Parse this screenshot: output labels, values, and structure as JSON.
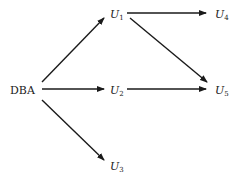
{
  "diagram": {
    "nodes": [
      {
        "id": "DBA",
        "label": "DBA",
        "sub": "",
        "x": 10,
        "y": 94
      },
      {
        "id": "U1",
        "label": "U",
        "sub": "1",
        "x": 110,
        "y": 18
      },
      {
        "id": "U2",
        "label": "U",
        "sub": "2",
        "x": 110,
        "y": 94
      },
      {
        "id": "U3",
        "label": "U",
        "sub": "3",
        "x": 110,
        "y": 170
      },
      {
        "id": "U4",
        "label": "U",
        "sub": "4",
        "x": 215,
        "y": 18
      },
      {
        "id": "U5",
        "label": "U",
        "sub": "5",
        "x": 215,
        "y": 94
      }
    ],
    "edges": [
      {
        "from": "DBA",
        "to": "U1",
        "x1": 42,
        "y1": 82,
        "x2": 104,
        "y2": 18
      },
      {
        "from": "DBA",
        "to": "U2",
        "x1": 42,
        "y1": 89,
        "x2": 104,
        "y2": 89
      },
      {
        "from": "DBA",
        "to": "U3",
        "x1": 42,
        "y1": 100,
        "x2": 104,
        "y2": 160
      },
      {
        "from": "U1",
        "to": "U4",
        "x1": 127,
        "y1": 13,
        "x2": 206,
        "y2": 13
      },
      {
        "from": "U1",
        "to": "U5",
        "x1": 130,
        "y1": 18,
        "x2": 207,
        "y2": 82
      },
      {
        "from": "U2",
        "to": "U5",
        "x1": 127,
        "y1": 89,
        "x2": 206,
        "y2": 89
      }
    ]
  }
}
